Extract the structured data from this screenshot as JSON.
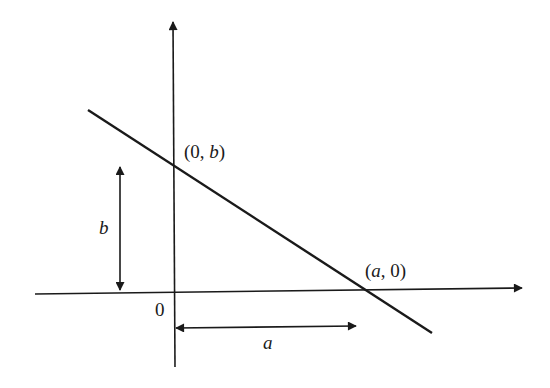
{
  "diagram": {
    "type": "line-intercepts",
    "labels": {
      "y_intercept": {
        "open": "(0, ",
        "var": "b",
        "close": ")"
      },
      "x_intercept": {
        "open": "(",
        "var": "a",
        "close": ", 0)"
      },
      "origin": "0",
      "height_dim": "b",
      "width_dim": "a"
    },
    "colors": {
      "stroke": "#1a1a1a",
      "background": "#ffffff"
    }
  }
}
